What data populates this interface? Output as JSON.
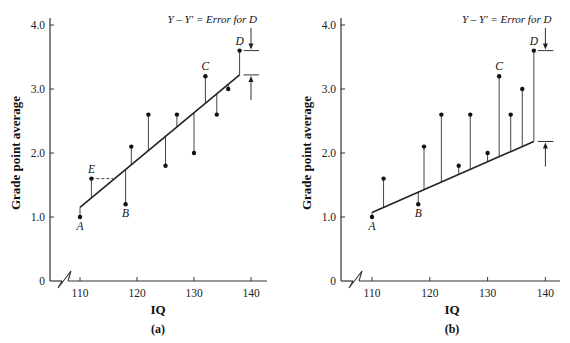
{
  "chart_data": [
    {
      "type": "scatter",
      "panel_label": "(a)",
      "xlabel": "IQ",
      "ylabel": "Grade point average",
      "xticks": [
        "110",
        "120",
        "130",
        "140"
      ],
      "yticks": [
        "0",
        "1.0",
        "2.0",
        "3.0",
        "4.0"
      ],
      "xlim": [
        105,
        142
      ],
      "ylim": [
        0,
        4.0
      ],
      "axis_break": true,
      "annotation": "Y – Y′ = Error for D",
      "points": [
        {
          "x": 110,
          "y": 1.0,
          "label": "A"
        },
        {
          "x": 112,
          "y": 1.6,
          "label": "E"
        },
        {
          "x": 118,
          "y": 1.2,
          "label": "B"
        },
        {
          "x": 119,
          "y": 2.1,
          "label": ""
        },
        {
          "x": 122,
          "y": 2.6,
          "label": ""
        },
        {
          "x": 125,
          "y": 1.8,
          "label": ""
        },
        {
          "x": 127,
          "y": 2.6,
          "label": ""
        },
        {
          "x": 130,
          "y": 2.0,
          "label": ""
        },
        {
          "x": 132,
          "y": 3.2,
          "label": "C"
        },
        {
          "x": 134,
          "y": 2.6,
          "label": ""
        },
        {
          "x": 136,
          "y": 3.0,
          "label": ""
        },
        {
          "x": 138,
          "y": 3.6,
          "label": "D"
        }
      ],
      "regression_line": {
        "x": [
          110,
          138
        ],
        "y": [
          1.15,
          3.22
        ]
      },
      "residuals_shown": true,
      "dashed_guide": {
        "from": [
          112,
          1.6
        ],
        "to": [
          115.8,
          1.6
        ]
      },
      "grid": false
    },
    {
      "type": "scatter",
      "panel_label": "(b)",
      "xlabel": "IQ",
      "ylabel": "Grade point average",
      "xticks": [
        "110",
        "120",
        "130",
        "140"
      ],
      "yticks": [
        "0",
        "1.0",
        "2.0",
        "3.0",
        "4.0"
      ],
      "xlim": [
        105,
        142
      ],
      "ylim": [
        0,
        4.0
      ],
      "axis_break": true,
      "annotation": "Y – Y′ = Error for D",
      "points": [
        {
          "x": 110,
          "y": 1.0,
          "label": "A"
        },
        {
          "x": 112,
          "y": 1.6,
          "label": ""
        },
        {
          "x": 118,
          "y": 1.2,
          "label": "B"
        },
        {
          "x": 119,
          "y": 2.1,
          "label": ""
        },
        {
          "x": 122,
          "y": 2.6,
          "label": ""
        },
        {
          "x": 125,
          "y": 1.8,
          "label": ""
        },
        {
          "x": 127,
          "y": 2.6,
          "label": ""
        },
        {
          "x": 130,
          "y": 2.0,
          "label": ""
        },
        {
          "x": 132,
          "y": 3.2,
          "label": "C"
        },
        {
          "x": 134,
          "y": 2.6,
          "label": ""
        },
        {
          "x": 136,
          "y": 3.0,
          "label": ""
        },
        {
          "x": 138,
          "y": 3.6,
          "label": "D"
        }
      ],
      "regression_line": {
        "x": [
          110,
          138
        ],
        "y": [
          1.07,
          2.18
        ]
      },
      "residuals_shown": true,
      "grid": false
    }
  ]
}
